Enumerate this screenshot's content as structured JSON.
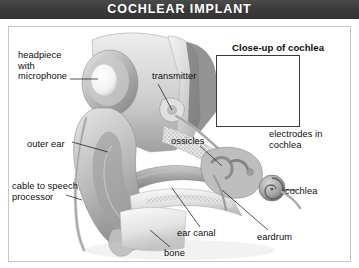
{
  "header": {
    "title": "COCHLEAR IMPLANT"
  },
  "diagram": {
    "type": "anatomical-illustration",
    "style": "grayscale medical illustration",
    "inset": {
      "caption": "Close-up of cochlea",
      "subject": "spiral cochlea with electrode array"
    },
    "labels": [
      {
        "id": "headpiece",
        "text": "headpiece\nwith\nmicrophone",
        "side": "left",
        "leader": "right"
      },
      {
        "id": "outer-ear",
        "text": "outer ear",
        "side": "left",
        "leader": "right"
      },
      {
        "id": "cable",
        "text": "cable to speech\nprocessor",
        "side": "left",
        "leader": "right"
      },
      {
        "id": "transmitter",
        "text": "transmitter",
        "side": "top",
        "leader": "down-left"
      },
      {
        "id": "ossicles",
        "text": "ossicles",
        "side": "center",
        "leader": "down-right"
      },
      {
        "id": "electrodes",
        "text": "electrodes in\ncochlea",
        "side": "right",
        "leader": "up-left"
      },
      {
        "id": "cochlea",
        "text": "cochlea",
        "side": "right",
        "leader": "left"
      },
      {
        "id": "eardrum",
        "text": "eardrum",
        "side": "bottom-right",
        "leader": "up-left"
      },
      {
        "id": "ear-canal",
        "text": "ear canal",
        "side": "bottom",
        "leader": "up-left"
      },
      {
        "id": "bone",
        "text": "bone",
        "side": "bottom",
        "leader": "up-left"
      }
    ]
  },
  "colors": {
    "title_bar": "#3b3b3b",
    "title_text": "#ffffff",
    "frame_border": "#c6c6c6",
    "inset_border": "#3a3a3a",
    "label_text": "#0e0e0e",
    "page_background": "#ffffff"
  }
}
